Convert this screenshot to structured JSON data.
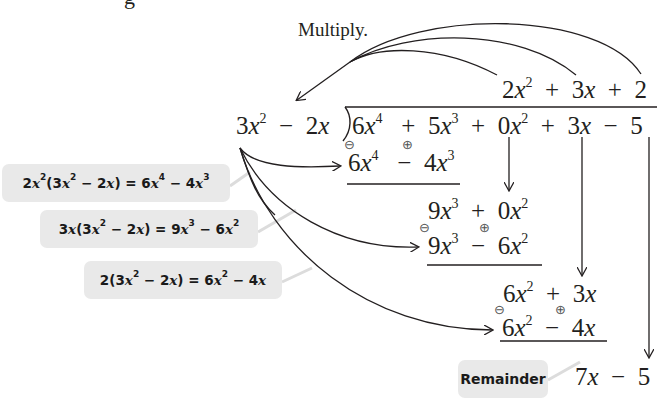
{
  "caption": "Multiply.",
  "partial_top_text": "g",
  "division": {
    "divisor": {
      "coef1": "3",
      "var1": "x",
      "exp1": "2",
      "op": "−",
      "coef2": "2",
      "var2": "x"
    },
    "dividend": [
      {
        "coef": "6",
        "var": "x",
        "exp": "4"
      },
      {
        "op": "+",
        "coef": "5",
        "var": "x",
        "exp": "3"
      },
      {
        "op": "+",
        "coef": "0",
        "var": "x",
        "exp": "2"
      },
      {
        "op": "+",
        "coef": "3",
        "var": "x"
      },
      {
        "op": "−",
        "coef": "5"
      }
    ],
    "quotient": [
      {
        "coef": "2",
        "var": "x",
        "exp": "2"
      },
      {
        "op": "+",
        "coef": "3",
        "var": "x"
      },
      {
        "op": "+",
        "coef": "2"
      }
    ],
    "steps": [
      {
        "product": {
          "t1": "6",
          "v1": "x",
          "e1": "4",
          "op": "−",
          "t2": "4",
          "v2": "x",
          "e2": "3"
        },
        "sign1": "⊖",
        "sign2": "⊕"
      },
      {
        "remainder": {
          "t1": "9",
          "v1": "x",
          "e1": "3",
          "op": "+",
          "t2": "0",
          "v2": "x",
          "e2": "2"
        }
      },
      {
        "product": {
          "t1": "9",
          "v1": "x",
          "e1": "3",
          "op": "−",
          "t2": "6",
          "v2": "x",
          "e2": "2"
        },
        "sign1": "⊖",
        "sign2": "⊕"
      },
      {
        "remainder": {
          "t1": "6",
          "v1": "x",
          "e1": "2",
          "op": "+",
          "t2": "3",
          "v2": "x"
        }
      },
      {
        "product": {
          "t1": "6",
          "v1": "x",
          "e1": "2",
          "op": "−",
          "t2": "4",
          "v2": "x"
        },
        "sign1": "⊖",
        "sign2": "⊕"
      },
      {
        "remainder": {
          "t1": "7",
          "v1": "x",
          "op": "−",
          "t2": "5"
        }
      }
    ]
  },
  "annotations": [
    {
      "text_a": "2",
      "var_a": "x",
      "exp_a": "2",
      "text_b": "(3",
      "var_b": "x",
      "exp_b": "2",
      "text_c": " − 2",
      "var_c": "x",
      "text_d": ") = 6",
      "var_d": "x",
      "exp_d": "4",
      "text_e": " − 4",
      "var_e": "x",
      "exp_e": "3"
    },
    {
      "text_a": "3",
      "var_a": "x",
      "text_b": "(3",
      "var_b": "x",
      "exp_b": "2",
      "text_c": " − 2",
      "var_c": "x",
      "text_d": ") = 9",
      "var_d": "x",
      "exp_d": "3",
      "text_e": " − 6",
      "var_e": "x",
      "exp_e": "2"
    },
    {
      "text_a": "2",
      "text_b": "(3",
      "var_b": "x",
      "exp_b": "2",
      "text_c": " − 2",
      "var_c": "x",
      "text_d": ") = 6",
      "var_d": "x",
      "exp_d": "2",
      "text_e": " − 4",
      "var_e": "x"
    }
  ],
  "remainder_label": "Remainder",
  "colors": {
    "ink": "#231f20",
    "label_bg": "#e9e9e9",
    "connector": "#d8d8d8"
  }
}
